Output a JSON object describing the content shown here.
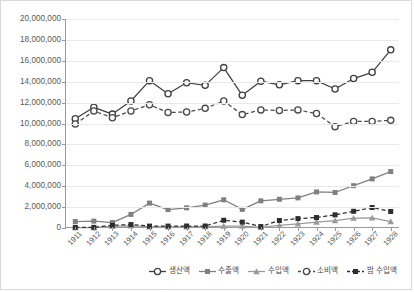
{
  "chart_data": {
    "type": "line",
    "title": "",
    "xlabel": "",
    "ylabel": "",
    "ylim": [
      0,
      20000000
    ],
    "ytick_step": 2000000,
    "grid": true,
    "legend_position": "bottom-right",
    "categories": [
      "1911",
      "1912",
      "1913",
      "1914",
      "1915",
      "1916",
      "1917",
      "1918",
      "1919",
      "1920",
      "1921",
      "1922",
      "1923",
      "1924",
      "1925",
      "1926",
      "1927",
      "1928"
    ],
    "ytick_labels": [
      "0",
      "2,000,000",
      "4,000,000",
      "6,000,000",
      "8,000,000",
      "10,000,000",
      "12,000,000",
      "14,000,000",
      "16,000,000",
      "18,000,000",
      "20,000,000"
    ],
    "series": [
      {
        "name": "생산액",
        "color": "#404040",
        "marker": "circle-open",
        "dash": "solid",
        "values": [
          10450000,
          11550000,
          10900000,
          12150000,
          14100000,
          12850000,
          13900000,
          13650000,
          15350000,
          12700000,
          14050000,
          13700000,
          14100000,
          14100000,
          13300000,
          14300000,
          14900000,
          17050000
        ]
      },
      {
        "name": "수출액",
        "color": "#808080",
        "marker": "square-filled",
        "dash": "solid",
        "values": [
          620000,
          660000,
          520000,
          1300000,
          2380000,
          1760000,
          1930000,
          2190000,
          2700000,
          1780000,
          2600000,
          2750000,
          2880000,
          3450000,
          3400000,
          4050000,
          4700000,
          5400000
        ]
      },
      {
        "name": "수입액",
        "color": "#9a9a9a",
        "marker": "triangle-filled",
        "dash": "solid",
        "values": [
          30000,
          40000,
          160000,
          210000,
          120000,
          110000,
          110000,
          130000,
          180000,
          180000,
          60000,
          260000,
          400000,
          560000,
          700000,
          940000,
          960000,
          620000
        ]
      },
      {
        "name": "소비액",
        "color": "#4a4a4a",
        "marker": "circle-open",
        "dash": "dashed",
        "values": [
          9950000,
          11200000,
          10550000,
          11200000,
          11800000,
          11050000,
          11100000,
          11450000,
          12150000,
          10850000,
          11300000,
          11250000,
          11300000,
          10950000,
          9700000,
          10200000,
          10200000,
          10300000
        ]
      },
      {
        "name": "밤 수입액",
        "color": "#2e2e2e",
        "marker": "square-filled",
        "dash": "dashed",
        "values": [
          60000,
          60000,
          260000,
          330000,
          180000,
          180000,
          190000,
          190000,
          740000,
          560000,
          140000,
          720000,
          900000,
          1000000,
          1260000,
          1600000,
          1960000,
          1580000
        ]
      }
    ]
  }
}
